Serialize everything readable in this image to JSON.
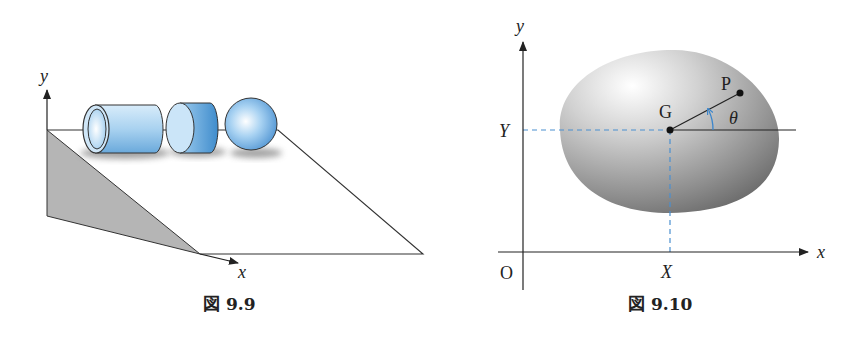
{
  "figures": [
    {
      "id": "fig-9-9",
      "caption": "図 9.9",
      "labels": {
        "y_axis": "y",
        "x_axis": "x"
      },
      "objects": [
        "hollow cylinder",
        "solid cylinder",
        "sphere"
      ],
      "colors": {
        "object_fill": "#8fc3e8",
        "incline_shade": "#b8b8b8"
      }
    },
    {
      "id": "fig-9-10",
      "caption": "図 9.10",
      "labels": {
        "y_axis": "y",
        "x_axis": "x",
        "origin": "O",
        "center_of_mass": "G",
        "point": "P",
        "angle": "θ",
        "coord_X": "X",
        "coord_Y": "Y"
      },
      "colors": {
        "guide_lines": "#4a8fd0",
        "body_fill": "#9a9a9a"
      }
    }
  ]
}
